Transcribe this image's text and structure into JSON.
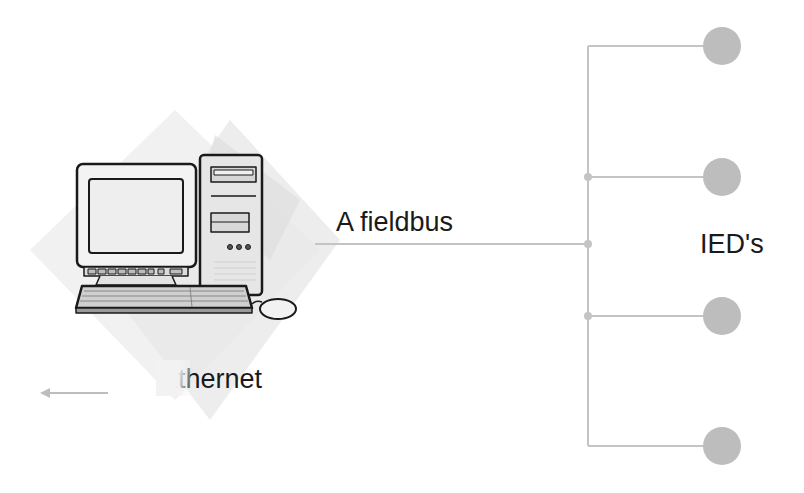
{
  "diagram": {
    "type": "network-topology",
    "labels": {
      "fieldbus": "A fieldbus",
      "ieds": "IED's",
      "ethernet": "Ethernet"
    },
    "nodes": {
      "computer": {
        "name": "workstation",
        "icon": "desktop-computer-icon"
      },
      "ieds": [
        {
          "id": "ied-1",
          "cx": 722,
          "cy": 46
        },
        {
          "id": "ied-2",
          "cx": 722,
          "cy": 177
        },
        {
          "id": "ied-3",
          "cx": 722,
          "cy": 316
        },
        {
          "id": "ied-4",
          "cx": 722,
          "cy": 446
        }
      ]
    },
    "connections": {
      "fieldbus_trunk": {
        "from": "workstation",
        "to": "bus-junction",
        "y": 244
      },
      "bus_vertical_x": 588,
      "branches_y": [
        46,
        177,
        316,
        446
      ],
      "junction_dots_y": [
        177,
        244,
        316
      ],
      "ethernet_arrow": {
        "direction": "left",
        "x1": 108,
        "x2": 40,
        "y": 393
      }
    },
    "colors": {
      "line": "#c4c4c4",
      "node": "#bdbdbd",
      "text": "#1a1a1a",
      "backdrop": "#ececec"
    }
  }
}
